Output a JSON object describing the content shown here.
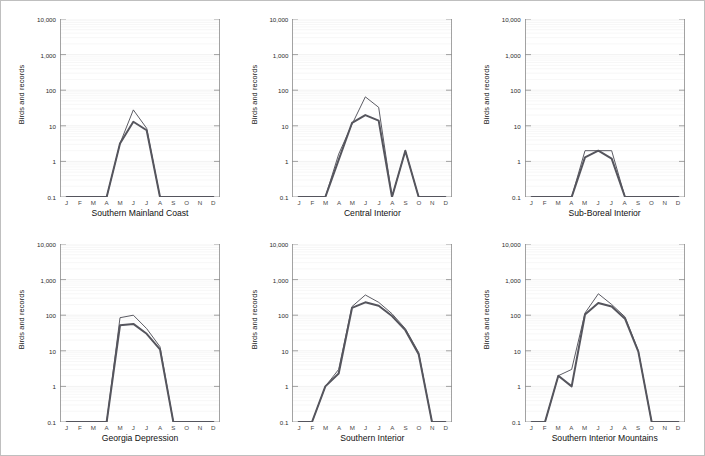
{
  "figure": {
    "background_color": "#ffffff",
    "border_color": "#bfbfbf",
    "line_color_thin": "#4a4a52",
    "line_color_thick": "#55555d",
    "axis_color": "#8c8c8c",
    "gridline_color": "#ececec"
  },
  "axes": {
    "ylabel": "Birds and records",
    "y_ticks": [
      "10,000",
      "1,000",
      "100",
      "10",
      "1",
      "0.1"
    ],
    "y_tick_values": [
      10000,
      1000,
      100,
      10,
      1,
      0.1
    ],
    "ylim": [
      0.1,
      10000
    ],
    "yscale": "log",
    "x_ticks": [
      "J",
      "F",
      "M",
      "A",
      "M",
      "J",
      "J",
      "A",
      "S",
      "O",
      "N",
      "D"
    ],
    "xlabel": ""
  },
  "chart_data": [
    {
      "type": "line",
      "title": "Southern Mainland Coast",
      "xlabel": "",
      "ylabel": "Birds and records",
      "yscale": "log",
      "ylim": [
        0.1,
        10000
      ],
      "grid": true,
      "legend": "none",
      "categories": [
        "J",
        "F",
        "M",
        "A",
        "M",
        "J",
        "J",
        "A",
        "S",
        "O",
        "N",
        "D"
      ],
      "series": [
        {
          "name": "records",
          "style": "thin",
          "values": [
            0.1,
            0.1,
            0.1,
            0.1,
            3.2,
            28,
            8.5,
            0.1,
            0.1,
            0.1,
            0.1,
            0.1
          ]
        },
        {
          "name": "birds",
          "style": "thick",
          "values": [
            0.1,
            0.1,
            0.1,
            0.1,
            3.2,
            13,
            7.5,
            0.1,
            0.1,
            0.1,
            0.1,
            0.1
          ]
        }
      ]
    },
    {
      "type": "line",
      "title": "Central Interior",
      "xlabel": "",
      "ylabel": "Birds and records",
      "yscale": "log",
      "ylim": [
        0.1,
        10000
      ],
      "grid": true,
      "legend": "none",
      "categories": [
        "J",
        "F",
        "M",
        "A",
        "M",
        "J",
        "J",
        "A",
        "S",
        "O",
        "N",
        "D"
      ],
      "series": [
        {
          "name": "records",
          "style": "thin",
          "values": [
            0.1,
            0.1,
            0.1,
            1.6,
            11,
            65,
            33,
            0.1,
            2.0,
            0.1,
            0.1,
            0.1
          ]
        },
        {
          "name": "birds",
          "style": "thick",
          "values": [
            0.1,
            0.1,
            0.1,
            1.1,
            12,
            20,
            14,
            0.1,
            2.0,
            0.1,
            0.1,
            0.1
          ]
        }
      ]
    },
    {
      "type": "line",
      "title": "Sub-Boreal Interior",
      "xlabel": "",
      "ylabel": "Birds and records",
      "yscale": "log",
      "ylim": [
        0.1,
        10000
      ],
      "grid": true,
      "legend": "none",
      "categories": [
        "J",
        "F",
        "M",
        "A",
        "M",
        "J",
        "J",
        "A",
        "S",
        "O",
        "N",
        "D"
      ],
      "series": [
        {
          "name": "records",
          "style": "thin",
          "values": [
            0.1,
            0.1,
            0.1,
            0.1,
            2.0,
            2.0,
            2.0,
            0.1,
            0.1,
            0.1,
            0.1,
            0.1
          ]
        },
        {
          "name": "birds",
          "style": "thick",
          "values": [
            0.1,
            0.1,
            0.1,
            0.1,
            1.3,
            2.0,
            1.2,
            0.1,
            0.1,
            0.1,
            0.1,
            0.1
          ]
        }
      ]
    },
    {
      "type": "line",
      "title": "Georgia Depression",
      "xlabel": "",
      "ylabel": "Birds and records",
      "yscale": "log",
      "ylim": [
        0.1,
        10000
      ],
      "grid": true,
      "legend": "none",
      "categories": [
        "J",
        "F",
        "M",
        "A",
        "M",
        "J",
        "J",
        "A",
        "S",
        "O",
        "N",
        "D"
      ],
      "series": [
        {
          "name": "records",
          "style": "thin",
          "values": [
            0.1,
            0.1,
            0.1,
            0.1,
            85,
            100,
            42,
            13,
            0.1,
            0.1,
            0.1,
            0.1
          ]
        },
        {
          "name": "birds",
          "style": "thick",
          "values": [
            0.1,
            0.1,
            0.1,
            0.1,
            52,
            57,
            30,
            11,
            0.1,
            0.1,
            0.1,
            0.1
          ]
        }
      ]
    },
    {
      "type": "line",
      "title": "Southern Interior",
      "xlabel": "",
      "ylabel": "Birds and records",
      "yscale": "log",
      "ylim": [
        0.1,
        10000
      ],
      "grid": true,
      "legend": "none",
      "categories": [
        "J",
        "F",
        "M",
        "A",
        "M",
        "J",
        "J",
        "A",
        "S",
        "O",
        "N",
        "D"
      ],
      "series": [
        {
          "name": "records",
          "style": "thin",
          "values": [
            0.1,
            0.1,
            1.0,
            3.0,
            175,
            370,
            230,
            110,
            42,
            9.0,
            0.1,
            0.1
          ]
        },
        {
          "name": "birds",
          "style": "thick",
          "values": [
            0.1,
            0.1,
            1.0,
            2.3,
            160,
            230,
            185,
            95,
            38,
            8.0,
            0.1,
            0.1
          ]
        }
      ]
    },
    {
      "type": "line",
      "title": "Southern Interior Mountains",
      "xlabel": "",
      "ylabel": "Birds and records",
      "yscale": "log",
      "ylim": [
        0.1,
        10000
      ],
      "grid": true,
      "legend": "none",
      "categories": [
        "J",
        "F",
        "M",
        "A",
        "M",
        "J",
        "J",
        "A",
        "S",
        "O",
        "N",
        "D"
      ],
      "series": [
        {
          "name": "records",
          "style": "thin",
          "values": [
            0.1,
            0.1,
            2.0,
            3.0,
            115,
            400,
            200,
            90,
            10,
            0.1,
            0.1,
            0.1
          ]
        },
        {
          "name": "birds",
          "style": "thick",
          "values": [
            0.1,
            0.1,
            2.0,
            1.0,
            105,
            220,
            175,
            80,
            9.5,
            0.1,
            0.1,
            0.1
          ]
        }
      ]
    }
  ]
}
